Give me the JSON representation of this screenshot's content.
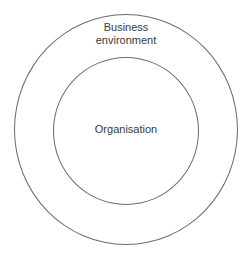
{
  "diagram": {
    "type": "nested-circles",
    "outer": {
      "label_line1": "Business",
      "label_line2": "environment"
    },
    "inner": {
      "label": "Organisation"
    },
    "colors": {
      "stroke": "#6a6a6a",
      "text": "#3a3a3a",
      "background": "#ffffff"
    }
  }
}
